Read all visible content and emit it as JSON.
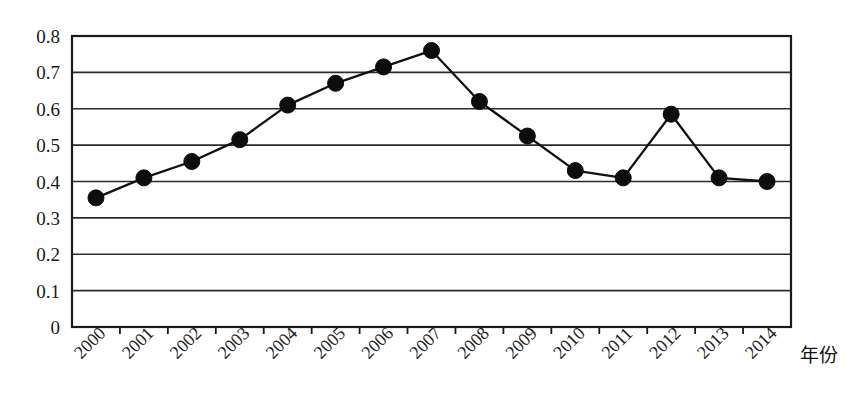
{
  "chart_data": {
    "type": "line",
    "title": "",
    "subtitle": "",
    "xlabel": "年份",
    "ylabel": "",
    "categories": [
      "2000",
      "2001",
      "2002",
      "2003",
      "2004",
      "2005",
      "2006",
      "2007",
      "2008",
      "2009",
      "2010",
      "2011",
      "2012",
      "2013",
      "2014"
    ],
    "values": [
      0.355,
      0.41,
      0.455,
      0.515,
      0.61,
      0.67,
      0.715,
      0.76,
      0.62,
      0.525,
      0.43,
      0.41,
      0.585,
      0.41,
      0.4
    ],
    "series": [
      {
        "name": "series-1",
        "values": [
          0.355,
          0.41,
          0.455,
          0.515,
          0.61,
          0.67,
          0.715,
          0.76,
          0.62,
          0.525,
          0.43,
          0.41,
          0.585,
          0.41,
          0.4
        ],
        "color": "#0d0d0d",
        "marker": "filled-circle"
      }
    ],
    "ylim": [
      0,
      0.8
    ],
    "ytick_labels": [
      "0",
      "0.1",
      "0.2",
      "0.3",
      "0.4",
      "0.5",
      "0.6",
      "0.7",
      "0.8"
    ],
    "ytick_values": [
      0,
      0.1,
      0.2,
      0.3,
      0.4,
      0.5,
      0.6,
      0.7,
      0.8
    ],
    "grid": "horizontal",
    "legend": "none",
    "xtick_rotation_deg": -45,
    "annotations": []
  },
  "axis": {
    "x_title": "年份"
  },
  "colors": {
    "line": "#0d0d0d",
    "marker": "#0d0d0d",
    "grid": "#2b2b2b",
    "frame": "#1a1a1a",
    "background": "#ffffff"
  }
}
